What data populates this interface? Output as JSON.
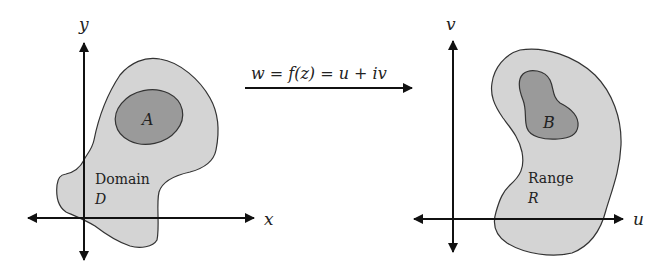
{
  "diagram": {
    "mapping": {
      "formula": "w = f(z) = u + iv"
    },
    "domain_plane": {
      "x_axis_label": "x",
      "y_axis_label": "y",
      "region_label": "Domain",
      "region_symbol": "D",
      "subset_label": "A"
    },
    "range_plane": {
      "u_axis_label": "u",
      "v_axis_label": "v",
      "region_label": "Range",
      "region_symbol": "R",
      "subset_label": "B"
    },
    "colors": {
      "background": "#ffffff",
      "region_fill": "#d4d4d4",
      "subset_fill": "#9a9a9a",
      "stroke": "#333333",
      "axis": "#111111"
    }
  }
}
